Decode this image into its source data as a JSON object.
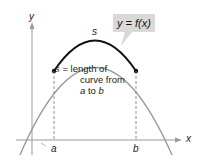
{
  "diagram": {
    "axis_x_label": "x",
    "axis_y_label": "y",
    "point_a_label": "a",
    "point_b_label": "b",
    "arc_label": "s",
    "function_label": "y = f(x)",
    "description": {
      "line1": "s = length of",
      "line2": "curve from",
      "line3": "a to b"
    },
    "colors": {
      "curve": "#999999",
      "arc": "#111111",
      "callout_bg": "#d9d9d9"
    }
  }
}
